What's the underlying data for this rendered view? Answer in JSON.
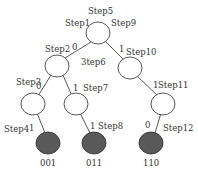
{
  "diagram": {
    "type": "binary-tree",
    "colors": {
      "internal_node_fill": "#ffffff",
      "leaf_fill": "#595959",
      "stroke": "#444444",
      "text": "#333333"
    },
    "steps": {
      "s1": "Step1",
      "s2": "Step2",
      "s3": "Step3",
      "s4": "Step4",
      "s5": "Step5",
      "s6": "3tep6",
      "s7": "Step7",
      "s8": "Step8",
      "s9": "Step9",
      "s10": "Step10",
      "s11": "Step11",
      "s12": "Step12"
    },
    "edge_bits": {
      "root_left": "0",
      "root_right": "1",
      "l_ll": "0",
      "l_lr": "1",
      "r_rr": "1",
      "ll_leaf": "1",
      "lr_leaf": "1",
      "rr_leaf": "0"
    },
    "leaf_codes": {
      "leaf1": "001",
      "leaf2": "011",
      "leaf3": "110"
    }
  }
}
